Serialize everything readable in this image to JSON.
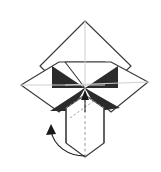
{
  "figure": {
    "background_color": "#ffffff",
    "stroke_color": "#3a3a3a",
    "fold_line_color": "#cfcfcf",
    "shade_color": "#2b2b2b",
    "arrow_color": "#1a1a1a",
    "paper_fill": "#ffffff",
    "stroke_width": 1.1,
    "fold_stroke_width": 1.0
  },
  "geometry": {
    "center": {
      "x": 85,
      "y": 88
    },
    "top_petal": {
      "name": "top-diamond-flap",
      "points": "85,21 131,66 85,110 40,66",
      "crease": {
        "x1": 85,
        "y1": 21,
        "x2": 85,
        "y2": 110
      }
    },
    "left_petal": {
      "name": "left-wing-flap",
      "points": "21,85 59,62 105,62 85,88 59,112",
      "crease": {
        "x1": 21,
        "y1": 85,
        "x2": 105,
        "y2": 85
      }
    },
    "right_petal": {
      "name": "right-wing-flap",
      "points": "148,82 111,62 65,62 85,88 111,112",
      "crease": {
        "x1": 148,
        "y1": 82,
        "x2": 65,
        "y2": 85
      }
    },
    "shade_triangles": [
      {
        "name": "shade-upper-left",
        "points": "52,66 85,88 52,88"
      },
      {
        "name": "shade-upper-right",
        "points": "118,66 85,88 118,88"
      },
      {
        "name": "shade-lower-left",
        "points": "50,111 85,88 72,111"
      },
      {
        "name": "shade-lower-right",
        "points": "120,108 85,88 98,111"
      }
    ],
    "tube": {
      "name": "central-tube",
      "outline": "85,95 104,108 104,143 85,157 66,143 66,108",
      "left_edge": {
        "x1": 66,
        "y1": 108,
        "x2": 66,
        "y2": 143
      },
      "right_edge": {
        "x1": 104,
        "y1": 108,
        "x2": 104,
        "y2": 143
      },
      "center_dashed": {
        "x1": 85,
        "y1": 99,
        "x2": 85,
        "y2": 157
      },
      "diag_dashed_left": {
        "x1": 66,
        "y1": 108,
        "x2": 85,
        "y2": 95
      },
      "diag_dashed_right": {
        "x1": 104,
        "y1": 108,
        "x2": 85,
        "y2": 95
      },
      "inner_dashed": {
        "x1": 70,
        "y1": 118,
        "x2": 95,
        "y2": 100
      }
    },
    "up_arrow": {
      "name": "push-up-arrow",
      "shaft": {
        "x1": 85,
        "y1": 112,
        "x2": 85,
        "y2": 95
      },
      "head": "85,90 81,100 89,100"
    },
    "curved_arrow": {
      "name": "rotation-arrow",
      "path": "M 85,156 C 68,156 54,146 51,131",
      "head": "51,124 46,135 56,134"
    }
  }
}
